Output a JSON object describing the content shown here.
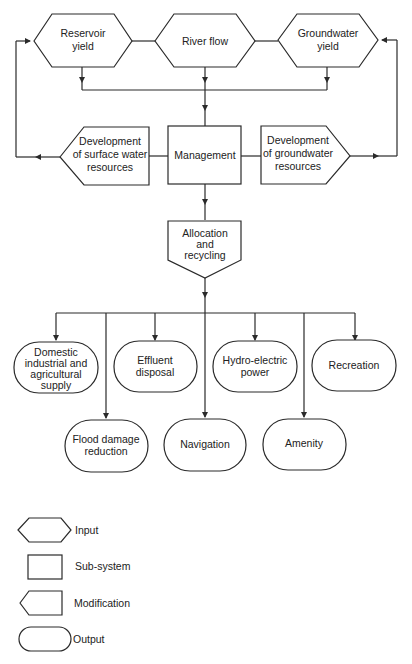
{
  "diagram": {
    "inputs": {
      "reservoir": [
        "Reservoir",
        "yield"
      ],
      "river": [
        "River flow"
      ],
      "groundwater": [
        "Groundwater",
        "yield"
      ]
    },
    "subsystem": {
      "management": [
        "Management"
      ]
    },
    "modifications": {
      "surface": [
        "Development",
        "of surface water",
        "resources"
      ],
      "groundwater": [
        "Development",
        "of groundwater",
        "resources"
      ],
      "allocation": [
        "Allocation",
        "and",
        "recycling"
      ]
    },
    "outputs": {
      "domestic": [
        "Domestic",
        "industrial and",
        "agricultural",
        "supply"
      ],
      "effluent": [
        "Effluent",
        "disposal"
      ],
      "hydro": [
        "Hydro-electric",
        "power"
      ],
      "recreation": [
        "Recreation"
      ],
      "flood": [
        "Flood damage",
        "reduction"
      ],
      "navigation": [
        "Navigation"
      ],
      "amenity": [
        "Amenity"
      ]
    }
  },
  "legend": {
    "input": "Input",
    "subsystem": "Sub-system",
    "modification": "Modification",
    "output": "Output"
  },
  "colors": {
    "stroke": "#2a2a2a",
    "background": "#ffffff",
    "text": "#222222"
  }
}
